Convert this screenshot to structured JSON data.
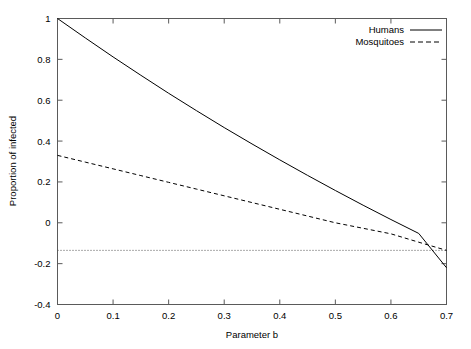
{
  "chart_data": {
    "type": "line",
    "title": "",
    "xlabel": "Parameter b",
    "ylabel": "Proportion of infected",
    "xlim": [
      0,
      0.7
    ],
    "ylim": [
      -0.4,
      1
    ],
    "grid": false,
    "legend_position": "top-right",
    "xticks": [
      "0",
      "0.1",
      "0.2",
      "0.3",
      "0.4",
      "0.5",
      "0.6",
      "0.7"
    ],
    "xtick_values": [
      0,
      0.1,
      0.2,
      0.3,
      0.4,
      0.5,
      0.6,
      0.7
    ],
    "yticks": [
      "1",
      "0.8",
      "0.6",
      "0.4",
      "0.2",
      "0",
      "-0.2",
      "-0.4"
    ],
    "ytick_values": [
      1,
      0.8,
      0.6,
      0.4,
      0.2,
      0,
      -0.2,
      -0.4
    ],
    "x": [
      0,
      0.05,
      0.1,
      0.15,
      0.2,
      0.25,
      0.3,
      0.35,
      0.4,
      0.45,
      0.5,
      0.55,
      0.6,
      0.65,
      0.7
    ],
    "series": [
      {
        "name": "Humans",
        "style": "solid",
        "color": "#000000",
        "values": [
          1.0,
          0.905,
          0.812,
          0.722,
          0.634,
          0.549,
          0.466,
          0.386,
          0.308,
          0.232,
          0.158,
          0.086,
          0.016,
          -0.052,
          -0.22
        ]
      },
      {
        "name": "Mosquitoes",
        "style": "dashed",
        "color": "#000000",
        "values": [
          0.33,
          0.297,
          0.264,
          0.231,
          0.198,
          0.165,
          0.132,
          0.099,
          0.066,
          0.033,
          0.0,
          -0.027,
          -0.054,
          -0.095,
          -0.135
        ]
      }
    ],
    "reference_lines": [
      {
        "name": "threshold",
        "orientation": "horizontal",
        "value": -0.135,
        "style": "dotted",
        "color": "#555555"
      }
    ],
    "annotations": []
  },
  "legend": {
    "items": [
      {
        "label": "Humans",
        "style": "solid"
      },
      {
        "label": "Mosquitoes",
        "style": "dashed"
      }
    ]
  }
}
